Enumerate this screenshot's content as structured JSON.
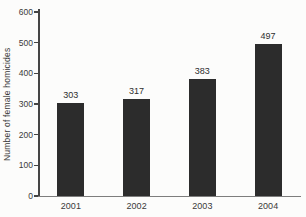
{
  "chart_data": {
    "type": "bar",
    "title": "",
    "xlabel": "",
    "ylabel": "Number of female homicides",
    "categories": [
      "2001",
      "2002",
      "2003",
      "2004"
    ],
    "values": [
      303,
      317,
      383,
      497
    ],
    "value_labels": [
      "303",
      "317",
      "383",
      "497"
    ],
    "ylim": [
      0,
      600
    ],
    "yticks": [
      0,
      100,
      200,
      300,
      400,
      500,
      600
    ],
    "grid": false,
    "legend": "none",
    "colors": {
      "background": "#fcfcfb",
      "bar": "#2c2c2c",
      "y_axis": "#454545",
      "x_axis": "#7d7d7d",
      "tick_text": "#3a3a3a",
      "value_text": "#2e2e2e"
    }
  }
}
